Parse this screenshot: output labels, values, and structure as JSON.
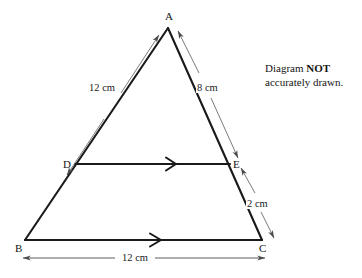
{
  "figure": {
    "type": "geometry-diagram",
    "shape": "triangle-with-parallel-transversal",
    "background_color": "#ffffff",
    "line_color": "#1a1a1a",
    "dimension_line_color": "#4a4a4a"
  },
  "note": {
    "line1_prefix": "Diagram ",
    "line1_strong": "NOT",
    "line2": "accurately drawn."
  },
  "vertices": [
    {
      "id": "A",
      "label": "A",
      "x": 168,
      "y": 28,
      "label_x": 165,
      "label_y": 11
    },
    {
      "id": "B",
      "label": "B",
      "x": 25,
      "y": 240,
      "label_x": 15,
      "label_y": 243
    },
    {
      "id": "C",
      "label": "C",
      "x": 262,
      "y": 240,
      "label_x": 259,
      "label_y": 243
    },
    {
      "id": "D",
      "label": "D",
      "x": 75,
      "y": 164,
      "label_x": 63,
      "label_y": 159
    },
    {
      "id": "E",
      "label": "E",
      "x": 230,
      "y": 164,
      "label_x": 233,
      "label_y": 159
    }
  ],
  "segments": [
    {
      "id": "AB",
      "from": "A",
      "to": "B",
      "role": "triangle-side"
    },
    {
      "id": "AC",
      "from": "A",
      "to": "C",
      "role": "triangle-side"
    },
    {
      "id": "BC",
      "from": "B",
      "to": "C",
      "role": "triangle-base",
      "tick": "single-arrow"
    },
    {
      "id": "DE",
      "from": "D",
      "to": "E",
      "role": "parallel-segment",
      "tick": "single-arrow"
    }
  ],
  "measurements": [
    {
      "id": "AD",
      "label": "12 cm",
      "segment": "A to D",
      "value": 12,
      "unit": "cm",
      "label_x": 88,
      "label_y": 82
    },
    {
      "id": "AE",
      "label": "8 cm",
      "segment": "A to E",
      "value": 8,
      "unit": "cm",
      "label_x": 196,
      "label_y": 82
    },
    {
      "id": "EC",
      "label": "2 cm",
      "segment": "E to C",
      "value": 2,
      "unit": "cm",
      "label_x": 246,
      "label_y": 198
    },
    {
      "id": "BC",
      "label": "12 cm",
      "segment": "B to C",
      "value": 12,
      "unit": "cm",
      "label_x": 121,
      "label_y": 252
    }
  ],
  "parallel_marks": {
    "de_arrow_x": 172,
    "bc_arrow_x": 157
  }
}
